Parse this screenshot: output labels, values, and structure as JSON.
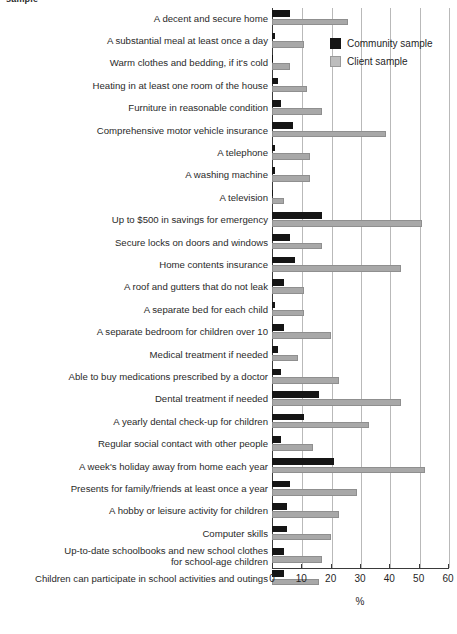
{
  "top_fragment": "sample",
  "legend": {
    "position": "top-right",
    "entries": [
      {
        "label": "Community sample",
        "color": "#151515",
        "icon": "legend-swatch-icon"
      },
      {
        "label": "Client sample",
        "color": "#bdbdbd",
        "icon": "legend-swatch-icon"
      }
    ]
  },
  "axis": {
    "title": "%",
    "ticks": [
      "0",
      "10",
      "20",
      "30",
      "40",
      "50",
      "60"
    ]
  },
  "chart_data": {
    "type": "bar",
    "orientation": "horizontal",
    "title": "",
    "xlabel": "%",
    "ylabel": "",
    "xlim": [
      0,
      60
    ],
    "xticks": [
      0,
      10,
      20,
      30,
      40,
      50,
      60
    ],
    "grid": true,
    "legend_position": "top-right",
    "categories": [
      "A decent and secure home",
      "A substantial meal at least once a day",
      "Warm clothes and bedding, if it's cold",
      "Heating in at least one room of the house",
      "Furniture in reasonable condition",
      "Comprehensive motor vehicle insurance",
      "A telephone",
      "A washing machine",
      "A television",
      "Up to $500 in savings for emergency",
      "Secure locks on doors and windows",
      "Home contents insurance",
      "A roof and gutters that do not leak",
      "A separate bed for each child",
      "A separate bedroom for children over 10",
      "Medical treatment  if needed",
      "Able to buy medications prescribed by a doctor",
      "Dental treatment if needed",
      "A yearly dental check-up for children",
      "Regular social contact with other people",
      "A week's holiday away from home each year",
      "Presents for family/friends at least once a year",
      "A hobby or leisure activity for children",
      "Computer skills",
      "Up-to-date schoolbooks and new school clothes\nfor school-age children",
      "Children can participate in school activities and outings"
    ],
    "series": [
      {
        "name": "Community sample",
        "color": "#151515",
        "values": [
          6,
          1,
          0.4,
          2,
          3,
          7,
          1,
          1,
          0.4,
          17,
          6,
          8,
          4,
          1,
          4,
          2,
          3,
          16,
          11,
          3,
          21,
          6,
          5,
          5,
          4,
          4
        ]
      },
      {
        "name": "Client sample",
        "color": "#bdbdbd",
        "values": [
          26,
          11,
          6,
          12,
          17,
          39,
          13,
          13,
          4,
          51,
          17,
          44,
          11,
          11,
          20,
          9,
          23,
          44,
          33,
          14,
          52,
          29,
          23,
          20,
          17,
          16
        ]
      }
    ]
  }
}
